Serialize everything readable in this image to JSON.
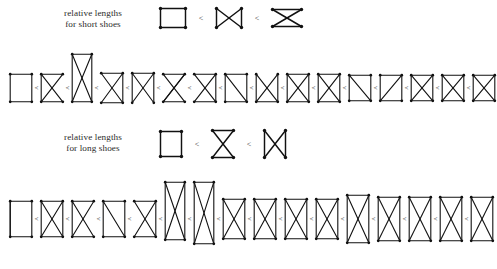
{
  "figure": {
    "type": "diagram",
    "kind": "partial-order-chains-of-vertex-configurations",
    "background": "#ffffff",
    "ink": "#111111",
    "relation_symbol": "<"
  },
  "sections": [
    {
      "id": "short",
      "label": {
        "line1": "relative lengths",
        "line2": "for short shoes"
      },
      "legend": {
        "relation": "<",
        "shapes": [
          {
            "name": "square",
            "edges": [
              "top",
              "right",
              "bottom",
              "left"
            ],
            "w": 30,
            "h": 24
          },
          {
            "name": "bowtie",
            "edges": [
              "left",
              "right",
              "diag1",
              "diag2"
            ],
            "w": 30,
            "h": 24
          },
          {
            "name": "hourglass",
            "edges": [
              "top",
              "bottom",
              "diag1",
              "diag2"
            ],
            "w": 34,
            "h": 22
          }
        ]
      },
      "chain": {
        "count": 16,
        "items": [
          {
            "w": 26,
            "h": 32,
            "dy": 0,
            "edges": [
              [
                0,
                1
              ],
              [
                2,
                3
              ],
              [
                0,
                3
              ],
              [
                1,
                2
              ]
            ]
          },
          {
            "w": 26,
            "h": 32,
            "dy": 0,
            "edges": [
              [
                0,
                1
              ],
              [
                2,
                3
              ],
              [
                0,
                2
              ],
              [
                1,
                3
              ],
              [
                3,
                0
              ]
            ]
          },
          {
            "w": 24,
            "h": 52,
            "dy": -10,
            "edges": [
              [
                0,
                1
              ],
              [
                1,
                2
              ],
              [
                2,
                3
              ],
              [
                3,
                0
              ],
              [
                0,
                2
              ],
              [
                1,
                3
              ]
            ]
          },
          {
            "w": 26,
            "h": 34,
            "dy": 0,
            "edges": [
              [
                0,
                1
              ],
              [
                2,
                3
              ],
              [
                0,
                2
              ],
              [
                1,
                3
              ],
              [
                1,
                2
              ]
            ]
          },
          {
            "w": 26,
            "h": 34,
            "dy": 0,
            "edges": [
              [
                0,
                2
              ],
              [
                1,
                3
              ],
              [
                0,
                3
              ],
              [
                1,
                2
              ],
              [
                0,
                1
              ]
            ]
          },
          {
            "w": 26,
            "h": 32,
            "dy": 0,
            "edges": [
              [
                0,
                1
              ],
              [
                2,
                3
              ],
              [
                0,
                2
              ],
              [
                1,
                3
              ],
              [
                3,
                1
              ]
            ]
          },
          {
            "w": 26,
            "h": 32,
            "dy": 0,
            "edges": [
              [
                0,
                1
              ],
              [
                1,
                2
              ],
              [
                2,
                3
              ],
              [
                0,
                2
              ],
              [
                1,
                3
              ]
            ]
          },
          {
            "w": 26,
            "h": 32,
            "dy": 0,
            "edges": [
              [
                0,
                1
              ],
              [
                2,
                3
              ],
              [
                0,
                2
              ],
              [
                0,
                3
              ],
              [
                1,
                2
              ]
            ]
          },
          {
            "w": 26,
            "h": 32,
            "dy": 0,
            "edges": [
              [
                0,
                2
              ],
              [
                1,
                3
              ],
              [
                0,
                3
              ],
              [
                1,
                2
              ],
              [
                2,
                3
              ]
            ]
          },
          {
            "w": 26,
            "h": 32,
            "dy": 0,
            "edges": [
              [
                0,
                1
              ],
              [
                0,
                2
              ],
              [
                1,
                3
              ],
              [
                2,
                3
              ],
              [
                0,
                3
              ],
              [
                1,
                2
              ]
            ]
          },
          {
            "w": 26,
            "h": 32,
            "dy": 0,
            "edges": [
              [
                0,
                1
              ],
              [
                2,
                3
              ],
              [
                0,
                2
              ],
              [
                1,
                3
              ],
              [
                0,
                3
              ],
              [
                1,
                2
              ]
            ]
          },
          {
            "w": 26,
            "h": 30,
            "dy": 0,
            "edges": [
              [
                0,
                1
              ],
              [
                2,
                3
              ],
              [
                0,
                3
              ],
              [
                1,
                2
              ],
              [
                0,
                2
              ]
            ]
          },
          {
            "w": 26,
            "h": 30,
            "dy": 0,
            "edges": [
              [
                0,
                1
              ],
              [
                2,
                3
              ],
              [
                0,
                3
              ],
              [
                1,
                2
              ],
              [
                1,
                3
              ]
            ]
          },
          {
            "w": 26,
            "h": 30,
            "dy": 0,
            "edges": [
              [
                0,
                1
              ],
              [
                2,
                3
              ],
              [
                0,
                2
              ],
              [
                1,
                3
              ],
              [
                0,
                3
              ],
              [
                1,
                2
              ]
            ]
          },
          {
            "w": 26,
            "h": 30,
            "dy": 0,
            "edges": [
              [
                0,
                2
              ],
              [
                1,
                3
              ],
              [
                0,
                3
              ],
              [
                1,
                2
              ],
              [
                0,
                1
              ],
              [
                2,
                3
              ]
            ]
          },
          {
            "w": 26,
            "h": 30,
            "dy": 0,
            "edges": [
              [
                0,
                2
              ],
              [
                1,
                3
              ],
              [
                0,
                3
              ],
              [
                1,
                2
              ],
              [
                0,
                1
              ],
              [
                2,
                3
              ]
            ]
          }
        ]
      }
    },
    {
      "id": "long",
      "label": {
        "line1": "relative lengths",
        "line2": "for long shoes"
      },
      "legend": {
        "relation": "<",
        "shapes": [
          {
            "name": "square",
            "edges": [
              "top",
              "right",
              "bottom",
              "left"
            ],
            "w": 26,
            "h": 30
          },
          {
            "name": "hourglass",
            "edges": [
              "top",
              "bottom",
              "diag1",
              "diag2"
            ],
            "w": 26,
            "h": 32
          },
          {
            "name": "bowtie",
            "edges": [
              "left",
              "right",
              "diag1",
              "diag2"
            ],
            "w": 26,
            "h": 32
          }
        ]
      },
      "chain": {
        "count": 16,
        "items": [
          {
            "w": 26,
            "h": 40,
            "dy": 0,
            "edges": [
              [
                0,
                1
              ],
              [
                2,
                3
              ],
              [
                0,
                3
              ],
              [
                1,
                2
              ],
              [
                3,
                0
              ]
            ]
          },
          {
            "w": 26,
            "h": 40,
            "dy": 0,
            "edges": [
              [
                0,
                1
              ],
              [
                2,
                3
              ],
              [
                0,
                2
              ],
              [
                1,
                3
              ],
              [
                0,
                3
              ],
              [
                1,
                2
              ]
            ]
          },
          {
            "w": 26,
            "h": 40,
            "dy": 0,
            "edges": [
              [
                0,
                1
              ],
              [
                2,
                3
              ],
              [
                0,
                2
              ],
              [
                1,
                3
              ],
              [
                3,
                0
              ]
            ]
          },
          {
            "w": 26,
            "h": 40,
            "dy": 0,
            "edges": [
              [
                0,
                1
              ],
              [
                1,
                2
              ],
              [
                2,
                3
              ],
              [
                3,
                0
              ],
              [
                0,
                2
              ]
            ]
          },
          {
            "w": 26,
            "h": 40,
            "dy": 0,
            "edges": [
              [
                0,
                1
              ],
              [
                2,
                3
              ],
              [
                0,
                2
              ],
              [
                1,
                3
              ],
              [
                1,
                2
              ]
            ]
          },
          {
            "w": 24,
            "h": 62,
            "dy": -8,
            "edges": [
              [
                0,
                1
              ],
              [
                1,
                2
              ],
              [
                2,
                3
              ],
              [
                3,
                0
              ],
              [
                0,
                2
              ],
              [
                1,
                3
              ]
            ]
          },
          {
            "w": 24,
            "h": 66,
            "dy": -6,
            "edges": [
              [
                0,
                1
              ],
              [
                1,
                2
              ],
              [
                2,
                3
              ],
              [
                3,
                0
              ],
              [
                0,
                2
              ],
              [
                1,
                3
              ]
            ]
          },
          {
            "w": 26,
            "h": 44,
            "dy": 0,
            "edges": [
              [
                0,
                1
              ],
              [
                0,
                2
              ],
              [
                1,
                3
              ],
              [
                2,
                3
              ],
              [
                0,
                3
              ],
              [
                1,
                2
              ]
            ]
          },
          {
            "w": 26,
            "h": 44,
            "dy": 0,
            "edges": [
              [
                0,
                1
              ],
              [
                2,
                3
              ],
              [
                0,
                2
              ],
              [
                1,
                3
              ],
              [
                0,
                3
              ],
              [
                1,
                2
              ]
            ]
          },
          {
            "w": 26,
            "h": 44,
            "dy": 0,
            "edges": [
              [
                0,
                1
              ],
              [
                2,
                3
              ],
              [
                0,
                3
              ],
              [
                1,
                2
              ],
              [
                0,
                2
              ],
              [
                1,
                3
              ]
            ]
          },
          {
            "w": 26,
            "h": 44,
            "dy": 0,
            "edges": [
              [
                0,
                2
              ],
              [
                1,
                3
              ],
              [
                0,
                3
              ],
              [
                1,
                2
              ],
              [
                0,
                1
              ],
              [
                2,
                3
              ]
            ]
          },
          {
            "w": 26,
            "h": 52,
            "dy": 0,
            "edges": [
              [
                0,
                1
              ],
              [
                2,
                3
              ],
              [
                0,
                2
              ],
              [
                1,
                3
              ],
              [
                0,
                3
              ],
              [
                1,
                2
              ]
            ]
          },
          {
            "w": 26,
            "h": 48,
            "dy": 0,
            "edges": [
              [
                0,
                1
              ],
              [
                2,
                3
              ],
              [
                0,
                2
              ],
              [
                1,
                3
              ],
              [
                0,
                3
              ],
              [
                1,
                2
              ]
            ]
          },
          {
            "w": 26,
            "h": 48,
            "dy": 0,
            "edges": [
              [
                0,
                2
              ],
              [
                1,
                3
              ],
              [
                0,
                3
              ],
              [
                1,
                2
              ],
              [
                0,
                1
              ],
              [
                2,
                3
              ]
            ]
          },
          {
            "w": 26,
            "h": 48,
            "dy": 0,
            "edges": [
              [
                0,
                1
              ],
              [
                2,
                3
              ],
              [
                0,
                2
              ],
              [
                1,
                3
              ],
              [
                0,
                3
              ],
              [
                1,
                2
              ]
            ]
          },
          {
            "w": 26,
            "h": 48,
            "dy": 0,
            "edges": [
              [
                0,
                1
              ],
              [
                2,
                3
              ],
              [
                0,
                2
              ],
              [
                1,
                3
              ],
              [
                0,
                3
              ],
              [
                1,
                2
              ]
            ]
          }
        ]
      }
    }
  ]
}
